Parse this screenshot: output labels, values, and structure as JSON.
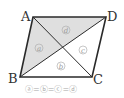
{
  "diagram": {
    "shape": "parallelogram",
    "vertices": [
      {
        "name": "A",
        "label": "A",
        "x": 33,
        "y": 17
      },
      {
        "name": "D",
        "label": "D",
        "x": 106,
        "y": 17
      },
      {
        "name": "B",
        "label": "B",
        "x": 20,
        "y": 77
      },
      {
        "name": "C",
        "label": "C",
        "x": 92,
        "y": 77
      }
    ],
    "regions": [
      {
        "id": "a",
        "label": "a",
        "shaded": true
      },
      {
        "id": "b",
        "label": "b",
        "shaded": false
      },
      {
        "id": "c",
        "label": "c",
        "shaded": false
      },
      {
        "id": "d",
        "label": "d",
        "shaded": true
      }
    ],
    "caption": "ⓐ=ⓑ=ⓒ=ⓓ",
    "colors": {
      "outline": "#2a2a2a",
      "shade": "#dcdcdc",
      "label_circle": "#b0b0b0"
    }
  }
}
